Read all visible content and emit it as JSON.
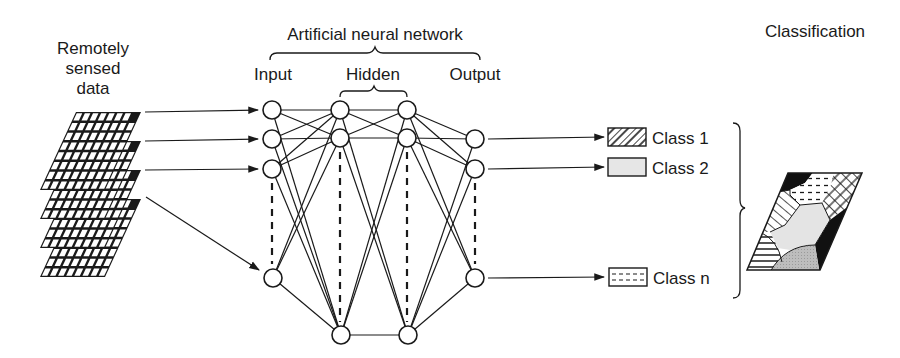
{
  "labels": {
    "input_data": [
      "Remotely",
      "sensed",
      "data"
    ],
    "network_title": "Artificial neural network",
    "input_layer": "Input",
    "hidden_layer": "Hidden",
    "output_layer": "Output",
    "classification": "Classification"
  },
  "classes": [
    {
      "label": "Class 1",
      "pattern": "crosshatch"
    },
    {
      "label": "Class 2",
      "pattern": "light-gray-fill"
    },
    {
      "label": "Class n",
      "pattern": "dashed-lines"
    }
  ],
  "network": {
    "input_nodes": [
      [
        272,
        110
      ],
      [
        272,
        139
      ],
      [
        272,
        169
      ],
      [
        273,
        278
      ]
    ],
    "hidden1_nodes": [
      [
        340,
        110
      ],
      [
        340,
        138
      ],
      [
        341,
        335
      ]
    ],
    "hidden2_nodes": [
      [
        407,
        110
      ],
      [
        407,
        138
      ],
      [
        408,
        335
      ]
    ],
    "output_nodes": [
      [
        475,
        139
      ],
      [
        475,
        169
      ],
      [
        475,
        278
      ]
    ]
  },
  "colors": {
    "line": "#1a1a1a",
    "class2_fill": "#e6e6e6",
    "map_gray": "#bdbdbd",
    "map_light": "#e4e4e4",
    "black": "#111111"
  }
}
